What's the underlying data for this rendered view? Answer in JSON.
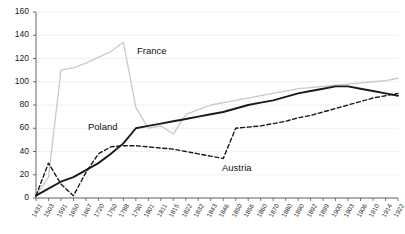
{
  "chart_data": {
    "type": "line",
    "title": "",
    "xlabel": "",
    "ylabel": "",
    "ylim": [
      0,
      160
    ],
    "ytick_step": 20,
    "yticks": [
      0,
      20,
      40,
      60,
      80,
      100,
      120,
      140,
      160
    ],
    "grid": true,
    "legend": "inline-labels",
    "categories": [
      "1431",
      "1503",
      "1591",
      "1650",
      "1667",
      "1720",
      "1750",
      "1788",
      "1790",
      "1801",
      "1811",
      "1815",
      "1822",
      "1832",
      "1843",
      "1846",
      "1850",
      "1856",
      "1860",
      "1870",
      "1880",
      "1890",
      "1892",
      "1899",
      "1900",
      "1903",
      "1906",
      "1910",
      "1914",
      "1922"
    ],
    "series": [
      {
        "name": "France",
        "color": "#c9c9c9",
        "style": "solid",
        "width": 1.3,
        "values": [
          2,
          18,
          110,
          112,
          116,
          121,
          126,
          134,
          78,
          60,
          62,
          55,
          72,
          76,
          80,
          82,
          84,
          86,
          88,
          90,
          92,
          94,
          95,
          96,
          97,
          98,
          99,
          100,
          101,
          103
        ]
      },
      {
        "name": "Poland",
        "color": "#1a1a1a",
        "style": "solid",
        "width": 1.9,
        "values": [
          2,
          8,
          14,
          18,
          24,
          30,
          38,
          47,
          60,
          62,
          64,
          66,
          68,
          70,
          72,
          74,
          77,
          80,
          82,
          84,
          87,
          90,
          92,
          94,
          96,
          96,
          94,
          92,
          90,
          88
        ]
      },
      {
        "name": "Austria",
        "color": "#1a1a1a",
        "style": "dashed",
        "width": 1.4,
        "values": [
          2,
          30,
          12,
          2,
          22,
          38,
          44,
          45,
          45,
          44,
          43,
          42,
          40,
          38,
          36,
          34,
          60,
          61,
          62,
          64,
          66,
          69,
          71,
          74,
          77,
          80,
          83,
          86,
          88,
          90
        ]
      }
    ],
    "annotations": [
      {
        "text": "France",
        "x_px": 137,
        "y_px": 46
      },
      {
        "text": "Poland",
        "x_px": 88,
        "y_px": 122
      },
      {
        "text": "Austria",
        "x_px": 222,
        "y_px": 163
      }
    ]
  }
}
